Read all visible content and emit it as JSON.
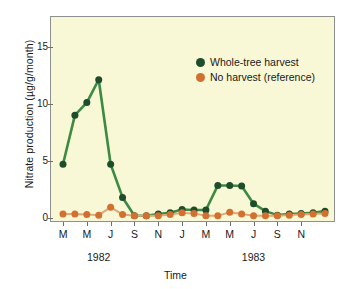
{
  "chart_data": {
    "type": "line",
    "title": "",
    "xlabel": "Time",
    "ylabel": "Nitrate production (µg/g/month)",
    "ylim": [
      0,
      17.5
    ],
    "yticks": [
      0,
      5,
      10,
      15
    ],
    "ytick_labels": [
      "0",
      "5",
      "10",
      "15"
    ],
    "grid": false,
    "legend_position": "upper right",
    "x": [
      "M",
      "A",
      "M",
      "J",
      "J",
      "A",
      "S",
      "O",
      "N",
      "D",
      "J",
      "F",
      "M",
      "A",
      "M",
      "J",
      "J",
      "A",
      "S",
      "O",
      "N",
      "D",
      "J"
    ],
    "xtick_labels": [
      "M",
      "",
      "M",
      "",
      "J",
      "",
      "S",
      "",
      "N",
      "",
      "J",
      "",
      "M",
      "",
      "M",
      "",
      "J",
      "",
      "S",
      "",
      "N",
      "",
      ""
    ],
    "period_labels": [
      {
        "label": "1982",
        "index": 3
      },
      {
        "label": "1983",
        "index": 16
      }
    ],
    "series": [
      {
        "name": "Whole-tree harvest",
        "color": "#1d4d2b",
        "values": [
          4.7,
          9.0,
          10.1,
          12.1,
          4.7,
          1.8,
          0.2,
          0.2,
          0.35,
          0.45,
          0.75,
          0.7,
          0.7,
          2.85,
          2.85,
          2.8,
          1.25,
          0.6,
          0.25,
          0.35,
          0.4,
          0.45,
          0.6
        ]
      },
      {
        "name": "No harvest (reference)",
        "color": "#d2712f",
        "values": [
          0.35,
          0.35,
          0.3,
          0.25,
          0.95,
          0.3,
          0.2,
          0.2,
          0.2,
          0.3,
          0.45,
          0.4,
          0.2,
          0.2,
          0.5,
          0.35,
          0.2,
          0.2,
          0.2,
          0.25,
          0.3,
          0.35,
          0.4
        ]
      }
    ]
  },
  "legend": {
    "items": [
      {
        "label": "Whole-tree harvest",
        "color": "#1d4d2b"
      },
      {
        "label": "No harvest (reference)",
        "color": "#d2712f"
      }
    ]
  },
  "axes": {
    "y_title": "Nitrate production (µg/g/month)",
    "x_title": "Time"
  }
}
